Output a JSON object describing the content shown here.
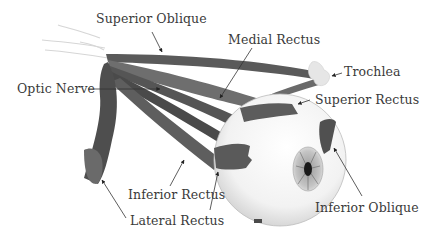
{
  "labels": {
    "superior_oblique": "Superior Oblique",
    "medial_rectus": "Medial Rectus",
    "optic_nerve": "Optic Nerve",
    "trochlea": "Trochlea",
    "superior_rectus": "Superior Rectus",
    "inferior_rectus": "Inferior Rectus",
    "lateral_rectus": "Lateral Rectus",
    "inferior_oblique": "Inferior Oblique"
  },
  "colors": {
    "muscle_dark": "#4a4a4a",
    "muscle_mid": "#626262",
    "muscle_light": "#7a7a7a",
    "eyeball": "#f4f4f4",
    "iris": "#b8b8b8",
    "pupil": "#1a1a1a",
    "label_text": "#3a3a3a",
    "leader_line": "#333333"
  }
}
